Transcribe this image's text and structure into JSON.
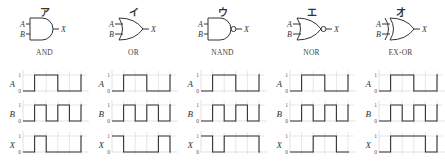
{
  "figure": {
    "panels": [
      {
        "id": "a",
        "title": "ア",
        "gate": "AND",
        "gate_type": "and",
        "inputs": [
          "A",
          "B"
        ],
        "output": "X",
        "waves": {
          "A": [
            0,
            1,
            1,
            0,
            0,
            1
          ],
          "B": [
            0,
            1,
            0,
            1,
            0,
            1
          ],
          "X": [
            0,
            1,
            0,
            0,
            0,
            1
          ]
        }
      },
      {
        "id": "i",
        "title": "イ",
        "gate": "OR",
        "gate_type": "or",
        "inputs": [
          "A",
          "B"
        ],
        "output": "X",
        "waves": {
          "A": [
            0,
            1,
            1,
            0,
            0,
            1
          ],
          "B": [
            0,
            1,
            0,
            1,
            0,
            1
          ],
          "X": [
            1,
            0,
            0,
            0,
            1,
            0
          ]
        }
      },
      {
        "id": "u",
        "title": "ウ",
        "gate": "NAND",
        "gate_type": "nand",
        "inputs": [
          "A",
          "B"
        ],
        "output": "X",
        "waves": {
          "A": [
            0,
            1,
            1,
            0,
            0,
            1
          ],
          "B": [
            0,
            1,
            0,
            1,
            0,
            1
          ],
          "X": [
            1,
            0,
            1,
            1,
            1,
            0
          ]
        }
      },
      {
        "id": "e",
        "title": "エ",
        "gate": "NOR",
        "gate_type": "nor",
        "inputs": [
          "A",
          "B"
        ],
        "output": "X",
        "waves": {
          "A": [
            0,
            1,
            1,
            0,
            0,
            1
          ],
          "B": [
            0,
            1,
            0,
            1,
            0,
            1
          ],
          "X": [
            0,
            0,
            1,
            1,
            0,
            0
          ]
        }
      },
      {
        "id": "o",
        "title": "オ",
        "gate": "EX-OR",
        "gate_type": "xor",
        "inputs": [
          "A",
          "B"
        ],
        "output": "X",
        "waves": {
          "A": [
            0,
            1,
            1,
            0,
            0,
            1
          ],
          "B": [
            0,
            1,
            0,
            1,
            0,
            1
          ],
          "X": [
            0,
            1,
            1,
            1,
            0,
            1
          ]
        }
      }
    ],
    "axis": {
      "high_label": "1",
      "low_label": "0"
    },
    "signal_labels": [
      "A",
      "B",
      "X"
    ],
    "colors": {
      "line": "#333333",
      "grid": "#cccccc",
      "text": "#333333"
    }
  }
}
